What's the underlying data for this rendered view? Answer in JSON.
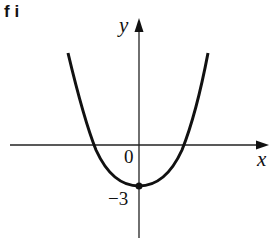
{
  "figure_label": "f i",
  "axes": {
    "x_label": "x",
    "y_label": "y",
    "origin_label": "0",
    "y_intercept_label": "−3"
  },
  "curve": {
    "type": "parabola",
    "opens": "upward",
    "vertex": [
      0,
      -3
    ],
    "y_intercept": -3,
    "color": "#111111"
  }
}
